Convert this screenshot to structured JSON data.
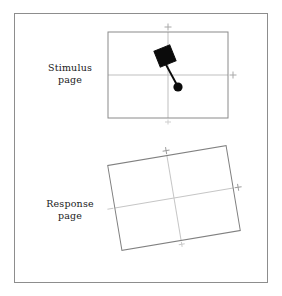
{
  "figure": {
    "background_color": "#ffffff",
    "frame": {
      "border_color": "#8d8d8d",
      "x": 14,
      "y": 13,
      "width": 254,
      "height": 270
    }
  },
  "panels": [
    {
      "id": "stimulus",
      "label_line1": "Stimulus",
      "label_line2": "page",
      "rect": {
        "x": 108,
        "y": 32,
        "width": 120,
        "height": 86
      },
      "rotation_deg": 0,
      "axis_color": "#b9b9b9",
      "border_color": "#8a8a8a",
      "ticks": [
        "top",
        "right",
        "bottom"
      ],
      "tick_glyph": "+"
    },
    {
      "id": "response",
      "label_line1": "Response",
      "label_line2": "page",
      "rect": {
        "x": 114,
        "y": 155,
        "width": 120,
        "height": 86
      },
      "rotation_deg": -9.5,
      "axis_color": "#c2c2c2",
      "border_color": "#808080",
      "ticks": [
        "top",
        "right",
        "bottom",
        "left"
      ],
      "tick_glyph": "+"
    }
  ],
  "stimulus_object": {
    "color": "#0b0b0b",
    "square": {
      "center_x": 165,
      "center_y": 56,
      "size": 17,
      "rotation_deg": -22
    },
    "connector": {
      "x1": 164,
      "y1": 61,
      "x2": 177,
      "y2": 85,
      "width": 1.8
    },
    "dot": {
      "cx": 178,
      "cy": 87,
      "r": 4.6
    }
  }
}
